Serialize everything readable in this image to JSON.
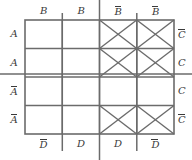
{
  "diagram": {
    "type": "karnaugh-map",
    "rows": 4,
    "cols": 4,
    "grid": {
      "x": 25,
      "y": 20,
      "w": 149,
      "h": 114,
      "col_w": 37.25,
      "row_h": 28.5,
      "line_color": "#6b6b6b",
      "line_width": 1.4,
      "border_color": "#6b6b6b",
      "border_width": 1.6
    },
    "mark_color": "#6b6b6b",
    "label_color": "#3a3a3a",
    "background": "#ffffff",
    "top_labels": [
      {
        "text": "B",
        "bar": false,
        "x": 43.6
      },
      {
        "text": "B",
        "bar": false,
        "x": 80.9
      },
      {
        "text": "B",
        "bar": true,
        "x": 118.1
      },
      {
        "text": "B",
        "bar": true,
        "x": 155.4
      }
    ],
    "left_labels": [
      {
        "text": "A",
        "bar": false,
        "y": 34.3
      },
      {
        "text": "A",
        "bar": false,
        "y": 62.8
      },
      {
        "text": "A",
        "bar": true,
        "y": 91.3
      },
      {
        "text": "A",
        "bar": true,
        "y": 119.8
      }
    ],
    "right_labels": [
      {
        "text": "C",
        "bar": true,
        "y": 34.3
      },
      {
        "text": "C",
        "bar": false,
        "y": 62.8
      },
      {
        "text": "C",
        "bar": false,
        "y": 91.3
      },
      {
        "text": "C",
        "bar": true,
        "y": 119.8
      }
    ],
    "bottom_labels": [
      {
        "text": "D",
        "bar": true,
        "x": 43.6
      },
      {
        "text": "D",
        "bar": false,
        "x": 80.9
      },
      {
        "text": "D",
        "bar": false,
        "x": 118.1
      },
      {
        "text": "D",
        "bar": true,
        "x": 155.4
      }
    ],
    "cells": [
      {
        "row": 0,
        "col": 0,
        "marked": false
      },
      {
        "row": 0,
        "col": 1,
        "marked": false
      },
      {
        "row": 0,
        "col": 2,
        "marked": true
      },
      {
        "row": 0,
        "col": 3,
        "marked": true
      },
      {
        "row": 1,
        "col": 0,
        "marked": false
      },
      {
        "row": 1,
        "col": 1,
        "marked": false
      },
      {
        "row": 1,
        "col": 2,
        "marked": true
      },
      {
        "row": 1,
        "col": 3,
        "marked": true
      },
      {
        "row": 2,
        "col": 0,
        "marked": false
      },
      {
        "row": 2,
        "col": 1,
        "marked": false
      },
      {
        "row": 2,
        "col": 2,
        "marked": false
      },
      {
        "row": 2,
        "col": 3,
        "marked": false
      },
      {
        "row": 3,
        "col": 0,
        "marked": false
      },
      {
        "row": 3,
        "col": 1,
        "marked": false
      },
      {
        "row": 3,
        "col": 2,
        "marked": true
      },
      {
        "row": 3,
        "col": 3,
        "marked": true
      }
    ],
    "group_lines": [
      {
        "orient": "h",
        "pos": 74.0,
        "from": 0,
        "to": 192
      },
      {
        "orient": "v",
        "pos": 62.3,
        "from": 13,
        "to": 151
      },
      {
        "orient": "v",
        "pos": 99.5,
        "from": 0,
        "to": 160
      },
      {
        "orient": "v",
        "pos": 136.8,
        "from": 13,
        "to": 151
      }
    ]
  }
}
